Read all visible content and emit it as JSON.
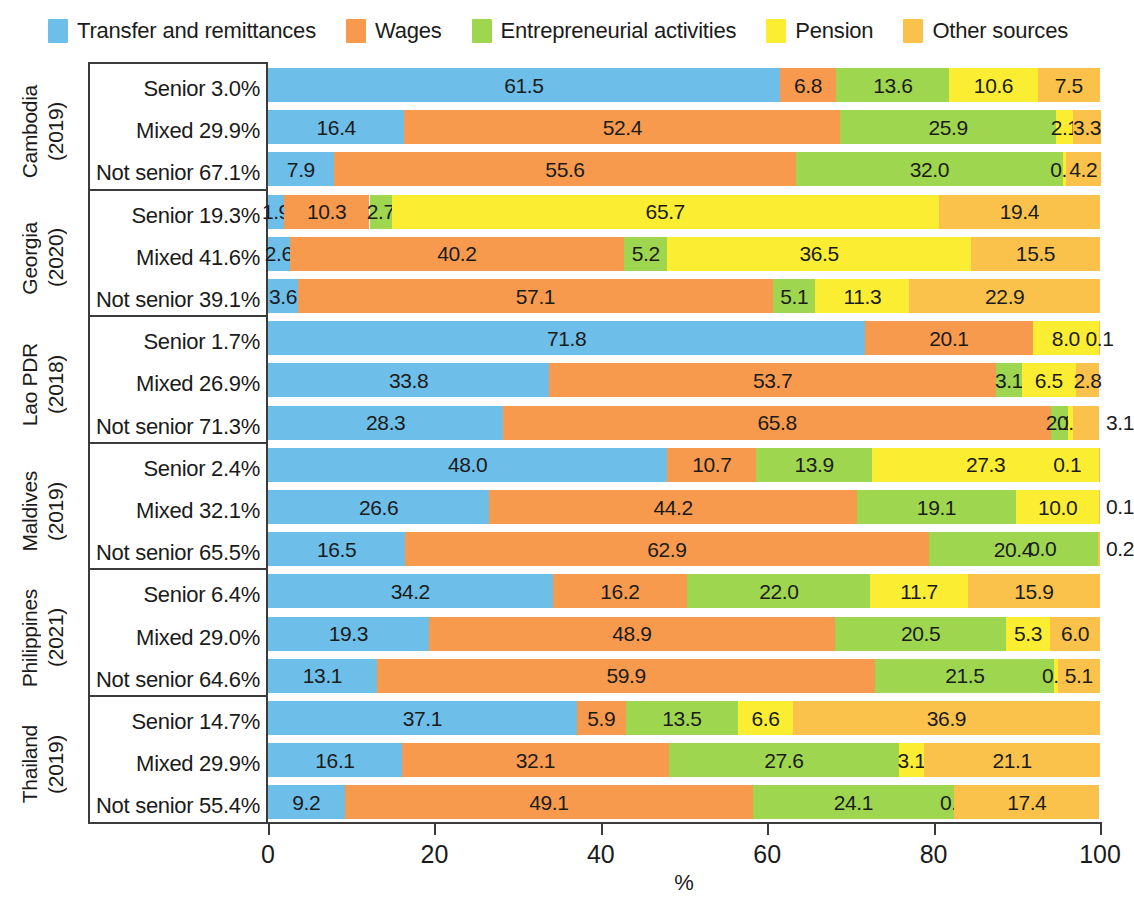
{
  "legend": {
    "items": [
      {
        "label": "Transfer and remittances",
        "color": "#6DBEE8",
        "key": "transfer"
      },
      {
        "label": "Wages",
        "color": "#F79A4E",
        "key": "wages"
      },
      {
        "label": "Entrepreneurial activities",
        "color": "#9ED64F",
        "key": "entrepreneurial"
      },
      {
        "label": "Pension",
        "color": "#FBEE32",
        "key": "pension"
      },
      {
        "label": "Other sources",
        "color": "#FAC24A",
        "key": "other"
      }
    ]
  },
  "axis": {
    "x_unit": "%",
    "ticks": [
      "0",
      "20",
      "40",
      "60",
      "80",
      "100"
    ],
    "tick_values": [
      0,
      20,
      40,
      60,
      80,
      100
    ],
    "xmin": 0,
    "xmax": 100
  },
  "chart_data": {
    "type": "bar",
    "orientation": "horizontal",
    "stacked": true,
    "title": "",
    "xlabel": "%",
    "ylabel": "",
    "xlim": [
      0,
      100
    ],
    "grid": false,
    "legend_position": "top",
    "series": [
      {
        "name": "Transfer and remittances",
        "color": "#6DBEE8"
      },
      {
        "name": "Wages",
        "color": "#F79A4E"
      },
      {
        "name": "Entrepreneurial activities",
        "color": "#9ED64F"
      },
      {
        "name": "Pension",
        "color": "#FBEE32"
      },
      {
        "name": "Other sources",
        "color": "#FAC24A"
      }
    ],
    "groups": [
      {
        "country": "Cambodia",
        "year": "(2019)",
        "rows": [
          {
            "label": "Senior 3.0%",
            "values": [
              61.5,
              6.8,
              13.6,
              10.6,
              7.5
            ],
            "labels": [
              "61.5",
              "6.8",
              "13.6",
              "10.6",
              "7.5"
            ],
            "outside": []
          },
          {
            "label": "Mixed 29.9%",
            "values": [
              16.4,
              52.4,
              25.9,
              2.1,
              3.3
            ],
            "labels": [
              "16.4",
              "52.4",
              "25.9",
              "2.1",
              "3.3"
            ],
            "outside": []
          },
          {
            "label": "Not senior 67.1%",
            "values": [
              7.9,
              55.6,
              32.0,
              0.4,
              4.2
            ],
            "labels": [
              "7.9",
              "55.6",
              "32.0",
              "0.4",
              "4.2"
            ],
            "outside": []
          }
        ]
      },
      {
        "country": "Georgia",
        "year": "(2020)",
        "rows": [
          {
            "label": "Senior 19.3%",
            "values": [
              1.9,
              10.3,
              2.7,
              65.7,
              19.4
            ],
            "labels": [
              "1.9",
              "10.3",
              "2.7",
              "65.7",
              "19.4"
            ],
            "outside": []
          },
          {
            "label": "Mixed 41.6%",
            "values": [
              2.6,
              40.2,
              5.2,
              36.5,
              15.5
            ],
            "labels": [
              "2.6",
              "40.2",
              "5.2",
              "36.5",
              "15.5"
            ],
            "outside": []
          },
          {
            "label": "Not senior 39.1%",
            "values": [
              3.6,
              57.1,
              5.1,
              11.3,
              22.9
            ],
            "labels": [
              "3.6",
              "57.1",
              "5.1",
              "11.3",
              "22.9"
            ],
            "outside": []
          }
        ]
      },
      {
        "country": "Lao PDR",
        "year": "(2018)",
        "rows": [
          {
            "label": "Senior 1.7%",
            "values": [
              71.8,
              20.1,
              0.0,
              8.0,
              0.1
            ],
            "labels": [
              "71.8",
              "20.1",
              "0.0",
              "8.0",
              "0.1"
            ],
            "outside": []
          },
          {
            "label": "Mixed 26.9%",
            "values": [
              33.8,
              53.7,
              3.1,
              6.5,
              2.8
            ],
            "labels": [
              "33.8",
              "53.7",
              "3.1",
              "6.5",
              "2.8"
            ],
            "outside": []
          },
          {
            "label": "Not senior 71.3%",
            "values": [
              28.3,
              65.8,
              2.1,
              0.6,
              3.1
            ],
            "labels": [
              "28.3",
              "65.8",
              "2.1",
              "0.6",
              ""
            ],
            "outside": [
              {
                "text": "3.1",
                "at": 100
              }
            ]
          }
        ]
      },
      {
        "country": "Maldives",
        "year": "(2019)",
        "rows": [
          {
            "label": "Senior 2.4%",
            "values": [
              48.0,
              10.7,
              13.9,
              27.3,
              0.1
            ],
            "labels": [
              "48.0",
              "10.7",
              "13.9",
              "27.3",
              ""
            ],
            "outside": [
              {
                "text": "0.1",
                "at": 97.5,
                "inside": true
              }
            ]
          },
          {
            "label": "Mixed 32.1%",
            "values": [
              26.6,
              44.2,
              19.1,
              10.0,
              0.1
            ],
            "labels": [
              "26.6",
              "44.2",
              "19.1",
              "10.0",
              ""
            ],
            "outside": [
              {
                "text": "0.1",
                "at": 100
              }
            ]
          },
          {
            "label": "Not senior 65.5%",
            "values": [
              16.5,
              62.9,
              20.4,
              0.0,
              0.2
            ],
            "labels": [
              "16.5",
              "62.9",
              "20.4",
              "",
              ""
            ],
            "outside": [
              {
                "text": "0.0",
                "at": 94.5,
                "inside": true
              },
              {
                "text": "0.2",
                "at": 100
              }
            ]
          }
        ]
      },
      {
        "country": "Philippines",
        "year": "(2021)",
        "rows": [
          {
            "label": "Senior 6.4%",
            "values": [
              34.2,
              16.2,
              22.0,
              11.7,
              15.9
            ],
            "labels": [
              "34.2",
              "16.2",
              "22.0",
              "11.7",
              "15.9"
            ],
            "outside": []
          },
          {
            "label": "Mixed 29.0%",
            "values": [
              19.3,
              48.9,
              20.5,
              5.3,
              6.0
            ],
            "labels": [
              "19.3",
              "48.9",
              "20.5",
              "5.3",
              "6.0"
            ],
            "outside": []
          },
          {
            "label": "Not senior 64.6%",
            "values": [
              13.1,
              59.9,
              21.5,
              0.4,
              5.1
            ],
            "labels": [
              "13.1",
              "59.9",
              "21.5",
              "0.4",
              "5.1"
            ],
            "outside": []
          }
        ]
      },
      {
        "country": "Thailand",
        "year": "(2019)",
        "rows": [
          {
            "label": "Senior 14.7%",
            "values": [
              37.1,
              5.9,
              13.5,
              6.6,
              36.9
            ],
            "labels": [
              "37.1",
              "5.9",
              "13.5",
              "6.6",
              "36.9"
            ],
            "outside": []
          },
          {
            "label": "Mixed 29.9%",
            "values": [
              16.1,
              32.1,
              27.6,
              3.1,
              21.1
            ],
            "labels": [
              "16.1",
              "32.1",
              "27.6",
              "3.1",
              "21.1"
            ],
            "outside": []
          },
          {
            "label": "Not senior 55.4%",
            "values": [
              9.2,
              49.1,
              24.1,
              0.1,
              17.4
            ],
            "labels": [
              "9.2",
              "49.1",
              "24.1",
              "0.1",
              "17.4"
            ],
            "outside": []
          }
        ]
      }
    ]
  }
}
